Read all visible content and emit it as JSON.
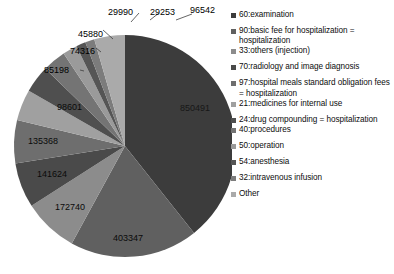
{
  "chart_data": {
    "type": "pie",
    "title": "",
    "subtitle": "",
    "xlabel": "",
    "ylabel": "",
    "legend_position": "right",
    "grid": false,
    "labels": [
      "60:examination",
      "90:basic fee for hospitalization = hospitalization",
      "33:others (injection)",
      "70:radiology and image diagnosis",
      "97:hospital meals standard obligation fees = hospitalization",
      "21:medicines for internal use",
      "24:drug compounding = hospitalization",
      "40:procedures",
      "50:operation",
      "54:anesthesia",
      "32:intravenous infusion",
      "Other"
    ],
    "values": [
      850491,
      403347,
      172740,
      141624,
      135368,
      98601,
      85198,
      74316,
      45880,
      29990,
      29253,
      96542
    ],
    "colors": [
      "#3c3c3c",
      "#606060",
      "#8c8c8c",
      "#4a4a4a",
      "#6e6e6e",
      "#a0a0a0",
      "#4f4f4f",
      "#747474",
      "#9a9a9a",
      "#555555",
      "#7c7c7c",
      "#aaaaaa"
    ],
    "total": 2163350
  },
  "legend": {
    "items": [
      {
        "label": "60:examination",
        "color": "#3c3c3c"
      },
      {
        "label": "90:basic fee for hospitalization = hospitalization",
        "color": "#606060"
      },
      {
        "label": "33:others (injection)",
        "color": "#8c8c8c"
      },
      {
        "label": "70:radiology and image diagnosis",
        "color": "#4a4a4a"
      },
      {
        "label": "97:hospital meals standard obligation fees = hospitalization",
        "color": "#6e6e6e"
      },
      {
        "label": "21:medicines for internal use",
        "color": "#a0a0a0"
      },
      {
        "label": "24:drug compounding = hospitalization",
        "color": "#4f4f4f"
      },
      {
        "label": "40:procedures",
        "color": "#747474"
      },
      {
        "label": "50:operation",
        "color": "#9a9a9a"
      },
      {
        "label": "54:anesthesia",
        "color": "#555555"
      },
      {
        "label": "32:intravenous infusion",
        "color": "#7c7c7c"
      },
      {
        "label": "Other",
        "color": "#aaaaaa"
      }
    ]
  },
  "pie_labels": {
    "v0": "850491",
    "v1": "403347",
    "v2": "172740",
    "v3": "141624",
    "v4": "135368",
    "v5": "98601",
    "v6": "85198",
    "v7": "74316",
    "v8": "45880",
    "v9": "29990",
    "v10": "29253",
    "v11": "96542"
  }
}
